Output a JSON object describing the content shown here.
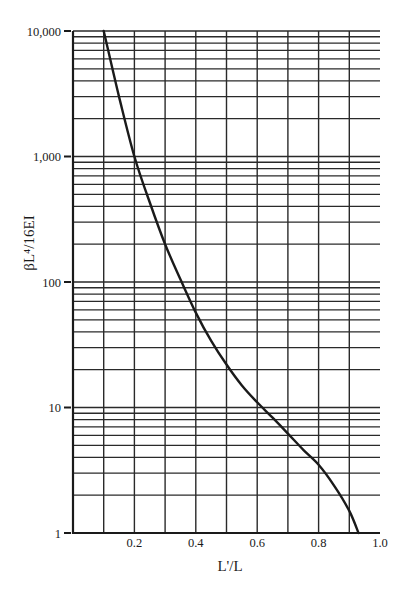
{
  "chart_data": {
    "type": "line",
    "title": "",
    "xlabel": "L'/L",
    "ylabel": "βL⁴/16EI",
    "xscale": "linear",
    "yscale": "log",
    "xlim": [
      0,
      1.0
    ],
    "ylim": [
      1,
      10000
    ],
    "grid": true,
    "x_ticks": [
      0.2,
      0.4,
      0.6,
      0.8,
      1.0
    ],
    "x_tick_labels": [
      "0.2",
      "0.4",
      "0.6",
      "0.8",
      "1.0"
    ],
    "x_grid": [
      0.1,
      0.2,
      0.3,
      0.4,
      0.5,
      0.6,
      0.7,
      0.8,
      0.9
    ],
    "y_ticks": [
      1,
      10,
      100,
      1000,
      10000
    ],
    "y_tick_labels": [
      "1",
      "10",
      "100",
      "1,000",
      "10,000"
    ],
    "series": [
      {
        "name": "βL⁴/16EI vs L'/L",
        "x": [
          0.1,
          0.15,
          0.2,
          0.25,
          0.3,
          0.35,
          0.4,
          0.45,
          0.5,
          0.55,
          0.6,
          0.65,
          0.7,
          0.75,
          0.8,
          0.85,
          0.9,
          0.93
        ],
        "y": [
          10000,
          3000,
          1000,
          430,
          200,
          105,
          57,
          34,
          22,
          15,
          11,
          8.3,
          6.2,
          4.6,
          3.5,
          2.4,
          1.5,
          1.0
        ]
      }
    ],
    "colors": {
      "line": "#1a1a1a",
      "grid": "#2a2a2a"
    }
  }
}
